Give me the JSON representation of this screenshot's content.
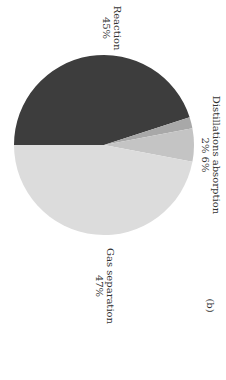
{
  "chart_data": {
    "type": "pie",
    "title": "",
    "panel_label": "(b)",
    "orientation": "rotated 90deg clockwise",
    "slices": [
      {
        "name": "Reaction",
        "value": 45,
        "label": "45%",
        "color": "#3d3d3d"
      },
      {
        "name": "Distillations",
        "value": 2,
        "label": "2%",
        "color": "#a8a8a8"
      },
      {
        "name": "absorption",
        "value": 6,
        "label": "6%",
        "color": "#c4c4c4"
      },
      {
        "name": "Gas separation",
        "value": 47,
        "label": "47%",
        "color": "#dcdcdc"
      }
    ],
    "labels": {
      "reaction": {
        "name": "Reaction",
        "pct": "45%"
      },
      "distill_absorb": {
        "name": "Distillations absorption",
        "pct": "2% 6%"
      },
      "gas_sep": {
        "name": "Gas separation",
        "pct": "47%"
      }
    }
  }
}
